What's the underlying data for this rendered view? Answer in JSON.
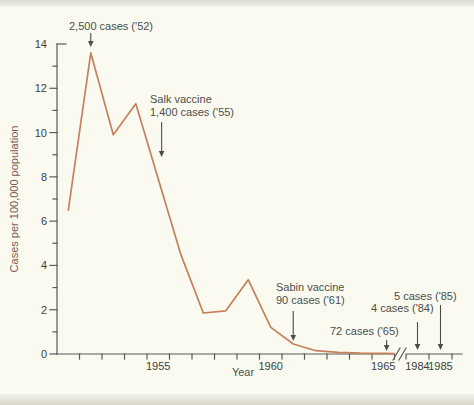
{
  "chart_data": {
    "type": "line",
    "xlabel": "Year",
    "ylabel": "Cases per 100,000 population",
    "ylim": [
      0,
      14
    ],
    "y_major_ticks": [
      0,
      2,
      4,
      6,
      8,
      10,
      12,
      14
    ],
    "y_minor_ticks": [
      1,
      3,
      5,
      7,
      9,
      11,
      13
    ],
    "x_labeled_ticks": [
      1955,
      1960,
      1965,
      1984,
      1985
    ],
    "x_minor_tick_years": "every year 1951-1965 marked by small ticks",
    "axis_break_between": [
      1965,
      1984
    ],
    "grid": false,
    "legend": "none",
    "line_color": "#c5815c",
    "series": [
      {
        "name": "cases per 100,000 population",
        "points": [
          [
            1951,
            6.5
          ],
          [
            1952,
            13.6
          ],
          [
            1953,
            9.9
          ],
          [
            1954,
            11.3
          ],
          [
            1956,
            4.5
          ],
          [
            1957,
            1.85
          ],
          [
            1958,
            1.95
          ],
          [
            1959,
            3.35
          ],
          [
            1960,
            1.2
          ],
          [
            1961,
            0.45
          ],
          [
            1962,
            0.15
          ],
          [
            1963,
            0.07
          ],
          [
            1964,
            0.04
          ],
          [
            1965,
            0.03
          ]
        ]
      }
    ],
    "post_break_points": [
      [
        1984,
        0
      ],
      [
        1985,
        0
      ]
    ],
    "annotations": [
      {
        "id": "peak-52",
        "year": 1952,
        "value": 13.6,
        "lines": [
          "2,500 cases ('52)"
        ]
      },
      {
        "id": "salk",
        "year": 1955,
        "value": 7.9,
        "lines": [
          "Salk vaccine",
          "1,400 cases ('55)"
        ]
      },
      {
        "id": "sabin",
        "year": 1961,
        "value": 0.45,
        "lines": [
          "Sabin vaccine",
          "90 cases ('61)"
        ]
      },
      {
        "id": "cases-65",
        "year": 1965,
        "value": 0.03,
        "lines": [
          "72 cases ('65)"
        ]
      },
      {
        "id": "cases-84",
        "year": 1984,
        "value": 0,
        "lines": [
          "4 cases ('84)"
        ]
      },
      {
        "id": "cases-85",
        "year": 1985,
        "value": 0,
        "lines": [
          "5 cases ('85)"
        ]
      }
    ],
    "colors": {
      "line": "#c5815c",
      "axis": "#555d58",
      "tick_text": "#3c423e",
      "annotation_text": "#4a4f4b",
      "y_axis_title": "#7d5a50",
      "background": "#fafaf1"
    }
  }
}
